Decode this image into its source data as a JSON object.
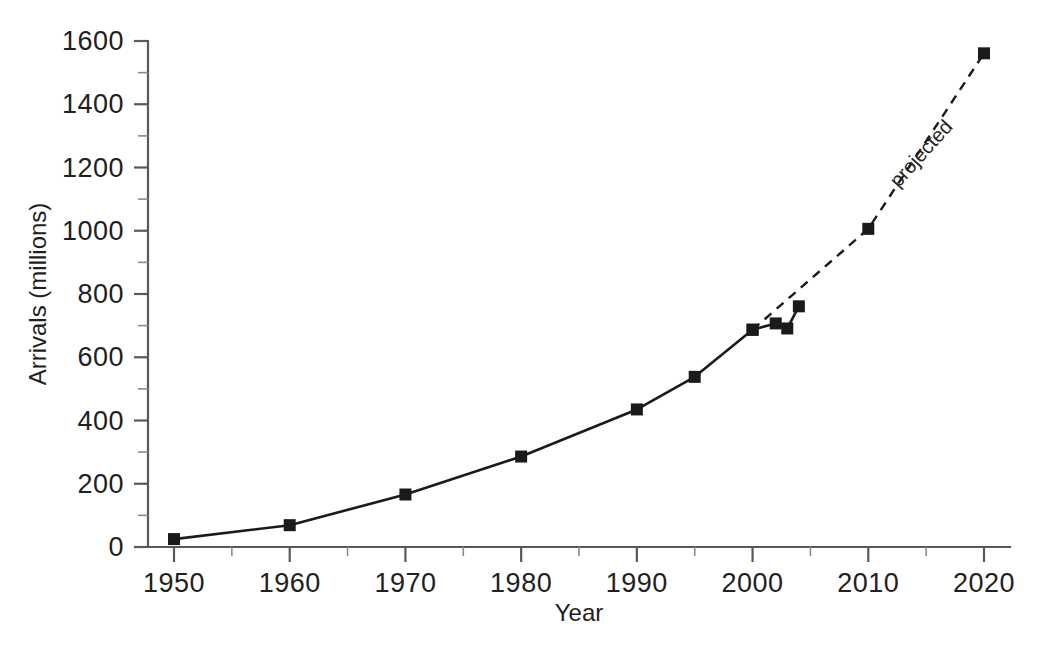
{
  "chart_data": {
    "type": "line",
    "title": "",
    "subtitle": "",
    "xlabel": "Year",
    "ylabel": "Arrivals (millions)",
    "xlim": [
      1946,
      2024
    ],
    "ylim": [
      0,
      1600
    ],
    "grid": false,
    "legend_position": "none",
    "x_ticks": [
      1950,
      1960,
      1970,
      1980,
      1990,
      2000,
      2010,
      2020
    ],
    "x_tick_labels": [
      "1950",
      "1960",
      "1970",
      "1980",
      "1990",
      "2000",
      "2010",
      "2020"
    ],
    "x_minor_tick_step": 5,
    "y_ticks": [
      0,
      200,
      400,
      600,
      800,
      1000,
      1200,
      1400,
      1600
    ],
    "y_tick_labels": [
      "0",
      "200",
      "400",
      "600",
      "800",
      "1000",
      "1200",
      "1400",
      "1600"
    ],
    "y_minor_tick_step": 100,
    "series": [
      {
        "name": "actual",
        "style": "solid",
        "marker": "square",
        "x": [
          1950,
          1960,
          1970,
          1980,
          1990,
          1995,
          2000,
          2002,
          2003,
          2004
        ],
        "values": [
          25,
          69,
          166,
          286,
          435,
          538,
          687,
          707,
          691,
          761
        ]
      },
      {
        "name": "projected",
        "style": "dashed",
        "marker": "square",
        "x": [
          2000,
          2010,
          2020
        ],
        "values": [
          687,
          1006,
          1561
        ]
      }
    ],
    "annotations": [
      {
        "text": "projected",
        "x": 2015,
        "y": 1230,
        "rotation": -48
      }
    ],
    "colors": {
      "line": "#1a1a1a",
      "marker": "#1a1a1a",
      "axis": "#58595b",
      "text": "#231f20",
      "background": "#ffffff"
    }
  }
}
